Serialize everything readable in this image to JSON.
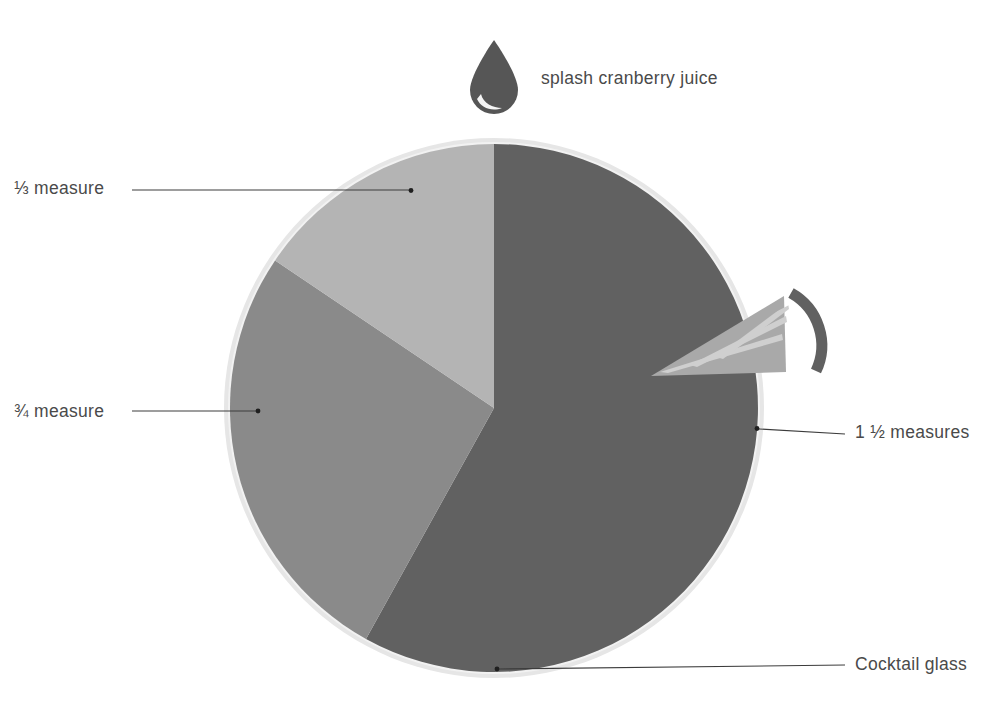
{
  "figure": {
    "title": "Cocktail recipe proportion diagram",
    "background_color": "#ffffff"
  },
  "colors": {
    "wedge_large": "#616161",
    "wedge_medium": "#8a8a8a",
    "wedge_small": "#b4b4b4",
    "glass_rim_ring": "#e2e2e2",
    "leader_line": "#3c3c3c",
    "label_text": "#4a4a4a",
    "droplet": "#565656"
  },
  "labels": {
    "splash": "splash cranberry juice",
    "third_measure": "⅓ measure",
    "three_quarter_measure": "¾ measure",
    "one_and_half_measures": "1 ½ measures",
    "cocktail_glass": "Cocktail glass"
  },
  "icons": {
    "droplet": "water-droplet-icon",
    "cocktail_glass": "cocktail-glass-icon"
  },
  "chart_data": {
    "type": "pie",
    "title": "Cocktail recipe proportion diagram",
    "xlabel": "",
    "ylabel": "",
    "grid": false,
    "legend_position": "callout-leader-lines",
    "units": "measures",
    "start_angle_deg": 0,
    "direction": "clockwise",
    "center_px": [
      494,
      408
    ],
    "radius_px": 264,
    "categories": [
      "1 ½ measures",
      "¾ measure",
      "⅓ measure"
    ],
    "values": [
      1.5,
      0.75,
      0.3333
    ],
    "slices": [
      {
        "label": "1 ½ measures",
        "value": 1.5,
        "percent": 58,
        "color": "#616161",
        "start_angle_deg": 0,
        "end_angle_deg": 209,
        "exploded": false,
        "callout_side": "right",
        "callout_dot_px": [
          757,
          428
        ]
      },
      {
        "label": "¾ measure",
        "value": 0.75,
        "percent": 29,
        "color": "#8a8a8a",
        "start_angle_deg": 209,
        "end_angle_deg": 304,
        "exploded": false,
        "callout_side": "left",
        "callout_dot_px": [
          258,
          411
        ]
      },
      {
        "label": "⅓ measure",
        "value": 0.3333,
        "percent": 13,
        "color": "#b4b4b4",
        "start_angle_deg": 304,
        "end_angle_deg": 360,
        "exploded": false,
        "callout_side": "left",
        "callout_dot_px": [
          411,
          191
        ]
      }
    ],
    "annotations": [
      {
        "label": "splash cranberry juice",
        "value": "splash",
        "icon": "water-droplet-icon",
        "position_px": [
          494,
          75
        ]
      },
      {
        "label": "Cocktail glass",
        "target": "outer rim of pie",
        "icon": "cocktail-glass-icon",
        "callout_dot_px": [
          497,
          669
        ]
      }
    ]
  }
}
